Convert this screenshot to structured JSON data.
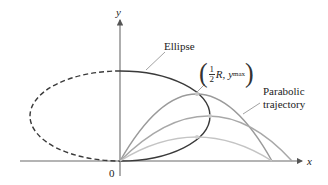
{
  "figure": {
    "axes": {
      "x_label": "x",
      "y_label": "y",
      "origin_label": "0"
    },
    "labels": {
      "ellipse": "Ellipse",
      "parabolic_line1": "Parabolic",
      "parabolic_line2": "trajectory",
      "point": {
        "frac_num": "1",
        "frac_den": "2",
        "var_R": "R,",
        "var_y": "y",
        "subscript": "max"
      }
    },
    "colors": {
      "axis": "#6b6b6b",
      "ellipse": "#3a3a3a",
      "parabola_dark": "#9a9a9a",
      "parabola_mid": "#a8a8a8",
      "parabola_light": "#c4c4c4",
      "text": "#222222"
    }
  }
}
